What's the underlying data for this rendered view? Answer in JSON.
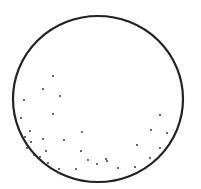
{
  "figure": {
    "stroke_color": "#222222",
    "background": "#ffffff",
    "circle": {
      "cx": 98,
      "cy": 99,
      "rx": 85,
      "ry": 83
    },
    "dots": [
      [
        53,
        76
      ],
      [
        43,
        89
      ],
      [
        60,
        96
      ],
      [
        24,
        100
      ],
      [
        53,
        114
      ],
      [
        21,
        118
      ],
      [
        30,
        131
      ],
      [
        43,
        139
      ],
      [
        64,
        140
      ],
      [
        82,
        132
      ],
      [
        25,
        137
      ],
      [
        31,
        142
      ],
      [
        46,
        151
      ],
      [
        81,
        151
      ],
      [
        88,
        160
      ],
      [
        97,
        164
      ],
      [
        106,
        159
      ],
      [
        107,
        161
      ],
      [
        118,
        168
      ],
      [
        59,
        169
      ],
      [
        76,
        169
      ],
      [
        137,
        145
      ],
      [
        151,
        130
      ],
      [
        160,
        115
      ],
      [
        167,
        133
      ],
      [
        160,
        148
      ],
      [
        150,
        158
      ],
      [
        135,
        167
      ],
      [
        40,
        157
      ],
      [
        34,
        155
      ],
      [
        27,
        148
      ],
      [
        48,
        163
      ]
    ]
  }
}
